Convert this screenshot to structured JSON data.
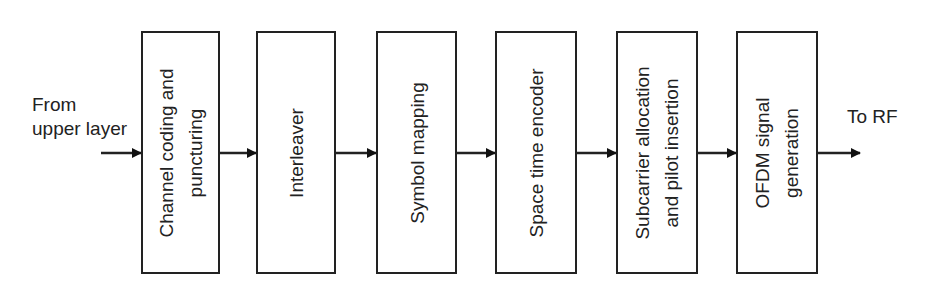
{
  "diagram": {
    "type": "block-diagram",
    "direction": "left-to-right",
    "input_label": [
      "From",
      "upper layer"
    ],
    "output_label": "To RF",
    "blocks": [
      {
        "id": "channel-coding",
        "lines": [
          "Channel coding and",
          "puncturing"
        ]
      },
      {
        "id": "interleaver",
        "lines": [
          "Interleaver"
        ]
      },
      {
        "id": "symbol-mapping",
        "lines": [
          "Symbol mapping"
        ]
      },
      {
        "id": "space-time-encoder",
        "lines": [
          "Space time encoder"
        ]
      },
      {
        "id": "subcarrier-allocation",
        "lines": [
          "Subcarrier allocation",
          "and pilot insertion"
        ]
      },
      {
        "id": "ofdm-signal-generation",
        "lines": [
          "OFDM signal",
          "generation"
        ]
      }
    ],
    "edges": [
      {
        "from": "input",
        "to": "channel-coding"
      },
      {
        "from": "channel-coding",
        "to": "interleaver"
      },
      {
        "from": "interleaver",
        "to": "symbol-mapping"
      },
      {
        "from": "symbol-mapping",
        "to": "space-time-encoder"
      },
      {
        "from": "space-time-encoder",
        "to": "subcarrier-allocation"
      },
      {
        "from": "subcarrier-allocation",
        "to": "ofdm-signal-generation"
      },
      {
        "from": "ofdm-signal-generation",
        "to": "output"
      }
    ],
    "colors": {
      "stroke": "#222222",
      "background": "#ffffff"
    }
  }
}
